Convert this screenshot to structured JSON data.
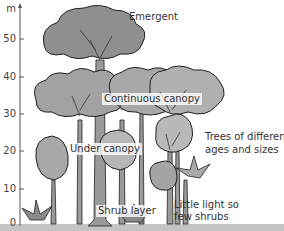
{
  "diagram": {
    "type": "rainforest layers",
    "axis": {
      "unit": "m",
      "ticks": [
        "50",
        "40",
        "30",
        "20",
        "10",
        "0"
      ]
    },
    "labels": {
      "emergent": "Emergent",
      "continuous_canopy": "Continuous canopy",
      "trees_different_1": "Trees of different",
      "trees_different_2": "ages and sizes",
      "under_canopy": "Under canopy",
      "shrub_layer": "Shrub layer",
      "little_light_1": "Little light so",
      "little_light_2": "few shrubs"
    },
    "colors": {
      "foliage": "#9a9a9a",
      "foliage_light": "#bdbdbd",
      "trunk": "#8a8a8a",
      "outline": "#222222",
      "ground": "#b8b8b8"
    }
  }
}
